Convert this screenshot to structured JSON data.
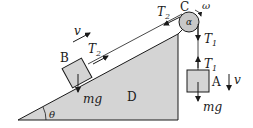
{
  "diagram": {
    "type": "physics-free-body",
    "colors": {
      "fill": "#d4d4d4",
      "stroke": "#1a1a1a",
      "background": "#ffffff"
    },
    "labels": {
      "pulley": "C",
      "pulley_angle": "α",
      "angular_velocity": "ω",
      "block_incline": "B",
      "block_hanging": "A",
      "wedge": "D",
      "incline_angle": "θ",
      "velocity_B": "v",
      "velocity_A": "v",
      "tension_T2_symbol": "T",
      "tension_T2_sub": "2",
      "tension_T1_symbol": "T",
      "tension_T1_sub": "1",
      "weight_B": "mg",
      "weight_A": "mg"
    }
  }
}
